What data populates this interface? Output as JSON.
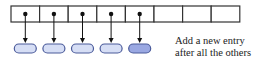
{
  "diagram": {
    "array": {
      "cell_count": 8,
      "x": 11,
      "y": 6,
      "cell_width": 28.6,
      "cell_height": 16,
      "stroke": "#333333",
      "filled_cells": [
        0,
        1,
        2,
        3,
        4
      ]
    },
    "nodes": [
      {
        "index": 0,
        "fill": "#d6def5",
        "stroke": "#4a5a9a",
        "highlight": false
      },
      {
        "index": 1,
        "fill": "#d6def5",
        "stroke": "#4a5a9a",
        "highlight": false
      },
      {
        "index": 2,
        "fill": "#d6def5",
        "stroke": "#4a5a9a",
        "highlight": false
      },
      {
        "index": 3,
        "fill": "#d6def5",
        "stroke": "#4a5a9a",
        "highlight": false
      },
      {
        "index": 4,
        "fill": "#9aa8e2",
        "stroke": "#4a5a9a",
        "highlight": true
      }
    ],
    "caption": {
      "line1": "Add a new entry",
      "line2": "after all the others"
    }
  }
}
